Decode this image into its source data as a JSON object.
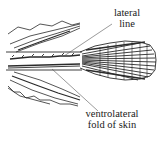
{
  "figure": {
    "line_color": "#2a2a2a",
    "background": "#ffffff"
  },
  "labels": {
    "lateral_line": {
      "line1": "lateral",
      "line2": "line"
    },
    "ventrolateral_fold": {
      "line1": "ventrolateral",
      "line2": "fold of skin"
    }
  }
}
